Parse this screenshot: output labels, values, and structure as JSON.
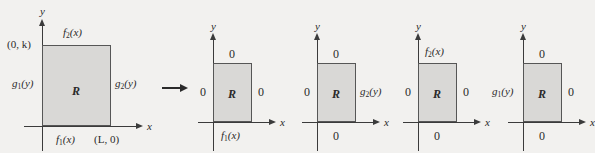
{
  "figure": {
    "caption_title": "Decomposition of a boundary value problem on a rectangle",
    "axis_labels": {
      "x": "x",
      "y": "y"
    },
    "region_label": "R",
    "transition_arrow": "→",
    "panels": [
      {
        "id": "original-problem",
        "name": "original",
        "top_label": "f₂(x)",
        "top_label_base": "f",
        "top_label_sub": "2",
        "top_label_arg": "(x)",
        "bottom_label_base": "f",
        "bottom_label_sub": "1",
        "bottom_label_arg": "(x)",
        "left_label_base": "g",
        "left_label_sub": "1",
        "left_label_arg": "(y)",
        "right_label_base": "g",
        "right_label_sub": "2",
        "right_label_arg": "(y)",
        "corner_point_top_left": "(0, k)",
        "corner_point_bottom_right": "(L, 0)",
        "region": "R"
      },
      {
        "id": "subproblem-1",
        "name": "subproblem-1",
        "top_label": "0",
        "bottom_label_base": "f",
        "bottom_label_sub": "1",
        "bottom_label_arg": "(x)",
        "left_label": "0",
        "right_label": "0",
        "region": "R"
      },
      {
        "id": "subproblem-2",
        "name": "subproblem-2",
        "top_label": "0",
        "bottom_label": "0",
        "left_label": "0",
        "right_label_base": "g",
        "right_label_sub": "2",
        "right_label_arg": "(y)",
        "region": "R"
      },
      {
        "id": "subproblem-3",
        "name": "subproblem-3",
        "top_label_base": "f",
        "top_label_sub": "2",
        "top_label_arg": "(x)",
        "bottom_label": "0",
        "left_label": "0",
        "right_label": "0",
        "region": "R"
      },
      {
        "id": "subproblem-4",
        "name": "subproblem-4",
        "top_label": "0",
        "bottom_label": "0",
        "left_label_base": "g",
        "left_label_sub": "1",
        "left_label_arg": "(y)",
        "right_label": "0",
        "region": "R"
      }
    ],
    "colors": {
      "background": "#f2f1ef",
      "region_fill": "#d9d8d6",
      "region_stroke": "#565656",
      "axis": "#3b3b3b",
      "text": "#2a2a2a"
    }
  }
}
